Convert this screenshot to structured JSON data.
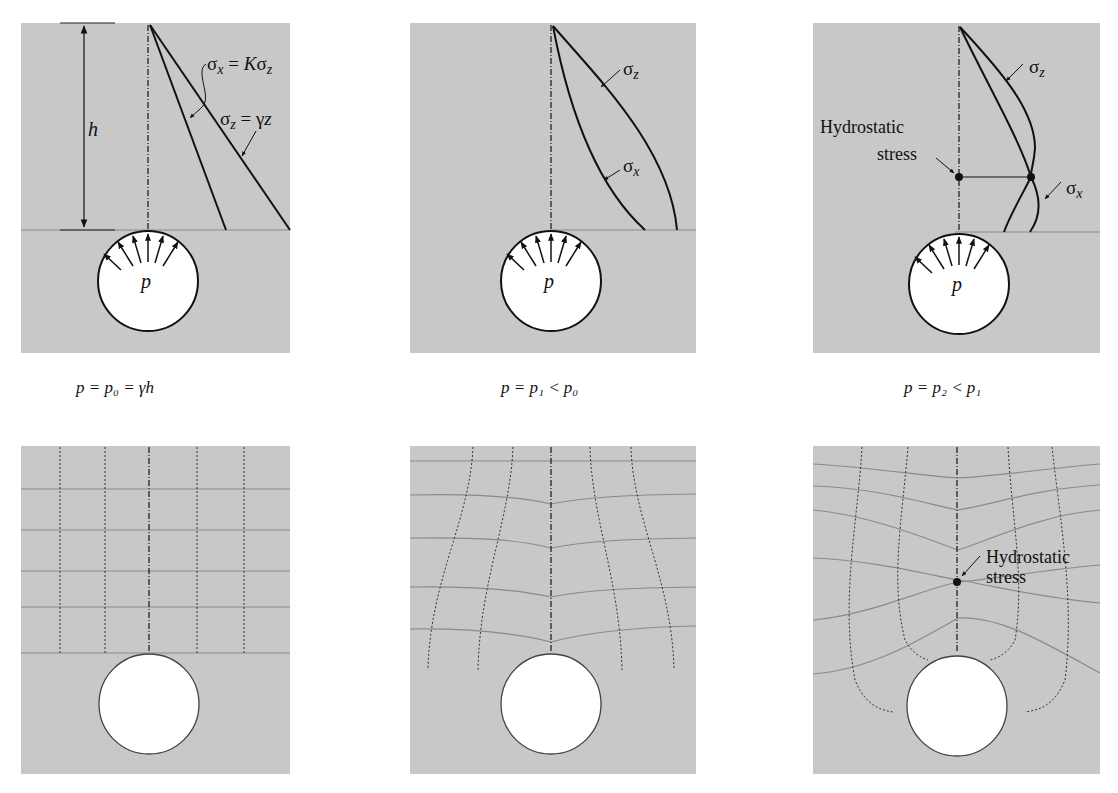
{
  "figure": {
    "colors": {
      "panel": "#c8c8c8",
      "ink": "#111111",
      "grid": "#8a8a8a",
      "cavity": "#ffffff"
    },
    "top_row": [
      {
        "id": "p0",
        "caption": "p = p₀ = γh",
        "labels": {
          "sigma_x_eq": "σx = Kσz",
          "sigma_z_eq": "σz =  γz",
          "depth": "h",
          "pressure": "p"
        }
      },
      {
        "id": "p1",
        "caption": "p = p₁ < p₀",
        "labels": {
          "sigma_z": "σz",
          "sigma_x": "σx",
          "pressure": "p"
        }
      },
      {
        "id": "p2",
        "caption": "p = p₂ < p₁",
        "labels": {
          "sigma_z": "σz",
          "sigma_x": "σx",
          "pressure": "p",
          "hydro_line1": "Hydrostatic",
          "hydro_line2": "stress"
        }
      }
    ],
    "bottom_row": [
      {
        "id": "grid-p0",
        "description": "undeformed stress trajectories"
      },
      {
        "id": "grid-p1",
        "description": "bent stress trajectories"
      },
      {
        "id": "grid-p2",
        "description": "strongly bent stress trajectories",
        "labels": {
          "hydro_line1": "Hydrostatic",
          "hydro_line2": "stress"
        }
      }
    ]
  }
}
